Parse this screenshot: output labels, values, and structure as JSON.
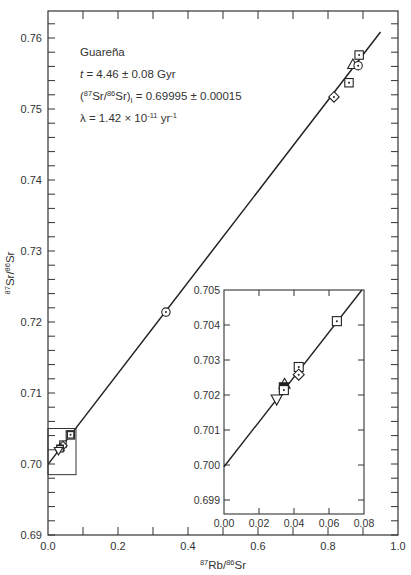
{
  "chart_data": {
    "type": "scatter",
    "title": "",
    "xlabel": "87Rb/86Sr",
    "ylabel": "87Sr/86Sr",
    "xlim": [
      0.0,
      1.0
    ],
    "ylim": [
      0.69,
      0.7638
    ],
    "grid": false,
    "x_ticks": [
      "0.0",
      "0.2",
      "0.4",
      "0.6",
      "0.8",
      "1.0"
    ],
    "y_ticks": [
      "0.69",
      "0.70",
      "0.71",
      "0.72",
      "0.73",
      "0.74",
      "0.75",
      "0.76"
    ],
    "annotations": {
      "name": "Guareña",
      "age": "t = 4.46 ± 0.08 Gyr",
      "initial_prefix": "(",
      "initial_sup1": "87",
      "initial_mid": "Sr/",
      "initial_sup2": "86",
      "initial_sr": "Sr)",
      "initial_sub": "I",
      "initial_value": " = 0.69995 ± 0.00015",
      "lambda_prefix": "λ = 1.42 × 10",
      "lambda_exp": "-11",
      "lambda_unit": " yr",
      "lambda_unit_exp": "-1"
    },
    "isochron": {
      "intercept": 0.69995,
      "slope": 0.0641,
      "x_range": [
        0.0,
        0.95
      ]
    },
    "series": [
      {
        "name": "main-plot-points",
        "points": [
          {
            "x": 0.337,
            "y": 0.7214,
            "marker": "circle-dot"
          },
          {
            "x": 0.817,
            "y": 0.7517,
            "marker": "diamond-dot"
          },
          {
            "x": 0.86,
            "y": 0.7537,
            "marker": "square-dot"
          },
          {
            "x": 0.871,
            "y": 0.7563,
            "marker": "triangle"
          },
          {
            "x": 0.886,
            "y": 0.7561,
            "marker": "circle-dot"
          },
          {
            "x": 0.889,
            "y": 0.7576,
            "marker": "square-dot"
          },
          {
            "x": 0.064,
            "y": 0.7041,
            "marker": "square-dot"
          }
        ]
      }
    ],
    "inset": {
      "xlim": [
        0.0,
        0.08
      ],
      "ylim": [
        0.6986,
        0.705
      ],
      "x_ticks": [
        "0.00",
        "0.02",
        "0.04",
        "0.06",
        "0.08"
      ],
      "y_ticks": [
        "0.699",
        "0.700",
        "0.701",
        "0.702",
        "0.703",
        "0.704",
        "0.705"
      ],
      "points": [
        {
          "x": 0.0645,
          "y": 0.70411,
          "marker": "square-dot"
        },
        {
          "x": 0.0427,
          "y": 0.7028,
          "marker": "square-dot"
        },
        {
          "x": 0.0427,
          "y": 0.70258,
          "marker": "diamond-dot"
        },
        {
          "x": 0.0346,
          "y": 0.70232,
          "marker": "triangle"
        },
        {
          "x": 0.0342,
          "y": 0.70222,
          "marker": "square-filled"
        },
        {
          "x": 0.0342,
          "y": 0.70214,
          "marker": "square-dot"
        },
        {
          "x": 0.0301,
          "y": 0.70187,
          "marker": "inverted-triangle"
        }
      ]
    },
    "locator_box": {
      "x0": 0.0,
      "x1": 0.08,
      "y0": 0.6985,
      "y1": 0.705
    }
  }
}
